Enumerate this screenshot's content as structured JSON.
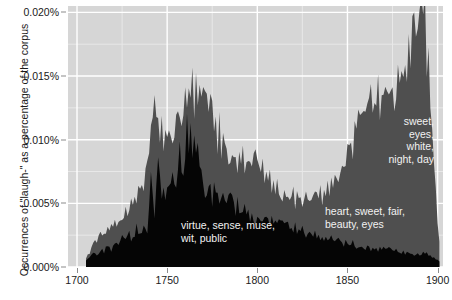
{
  "chart_data": {
    "type": "area",
    "title": "",
    "subtitle": "",
    "xlabel": "",
    "ylabel": "Occurrences of \"laugh-\" as a percentage of the corpus",
    "xlim": [
      1695,
      1903
    ],
    "ylim": [
      0.0,
      0.0205
    ],
    "grid": true,
    "legend_position": "none",
    "stacked": true,
    "x_ticks": [
      1700,
      1750,
      1800,
      1850,
      1900
    ],
    "x_tick_labels": [
      "1700",
      "1750",
      "1800",
      "1850",
      "1900"
    ],
    "x_minor_ticks": [
      1725,
      1775,
      1825,
      1875
    ],
    "y_ticks": [
      0.0,
      0.005,
      0.01,
      0.015,
      0.02
    ],
    "y_tick_labels": [
      "0.000%",
      "0.005%",
      "0.010%",
      "0.015%",
      "0.020%"
    ],
    "y_minor_ticks": [
      0.0025,
      0.0075,
      0.0125,
      0.0175
    ],
    "panel_background": "#d6d6d6",
    "gridline_major_color": "#ffffff",
    "gridline_minor_color": "#e8e8e8",
    "axis_text_color": "#1a1a1a",
    "series": [
      {
        "name": "lower-topic",
        "color": "#050505",
        "x": [
          1705,
          1707,
          1709,
          1711,
          1713,
          1715,
          1717,
          1719,
          1721,
          1723,
          1725,
          1727,
          1729,
          1731,
          1733,
          1735,
          1737,
          1739,
          1741,
          1743,
          1745,
          1747,
          1749,
          1751,
          1753,
          1755,
          1757,
          1759,
          1761,
          1763,
          1765,
          1767,
          1769,
          1771,
          1773,
          1775,
          1777,
          1779,
          1781,
          1783,
          1785,
          1787,
          1789,
          1791,
          1793,
          1795,
          1797,
          1799,
          1801,
          1803,
          1805,
          1807,
          1809,
          1811,
          1813,
          1815,
          1817,
          1819,
          1821,
          1823,
          1825,
          1827,
          1829,
          1831,
          1833,
          1835,
          1837,
          1839,
          1841,
          1843,
          1845,
          1847,
          1849,
          1851,
          1853,
          1855,
          1857,
          1859,
          1861,
          1863,
          1865,
          1867,
          1869,
          1871,
          1873,
          1875,
          1877,
          1879,
          1881,
          1883,
          1885,
          1887,
          1889,
          1891,
          1893,
          1895,
          1897,
          1899,
          1901
        ],
        "values": [
          0.0005,
          0.0008,
          0.0012,
          0.001,
          0.0014,
          0.0011,
          0.0017,
          0.0013,
          0.002,
          0.0016,
          0.0025,
          0.002,
          0.0026,
          0.0022,
          0.003,
          0.0025,
          0.0036,
          0.003,
          0.0075,
          0.004,
          0.0088,
          0.0055,
          0.0062,
          0.0058,
          0.0065,
          0.006,
          0.0088,
          0.007,
          0.0105,
          0.011,
          0.0098,
          0.0105,
          0.0085,
          0.006,
          0.0068,
          0.0055,
          0.0062,
          0.005,
          0.0056,
          0.0048,
          0.0052,
          0.0045,
          0.005,
          0.0042,
          0.0046,
          0.004,
          0.0044,
          0.0038,
          0.0042,
          0.0036,
          0.004,
          0.0034,
          0.0038,
          0.0032,
          0.0036,
          0.003,
          0.0034,
          0.0029,
          0.0032,
          0.0027,
          0.003,
          0.0026,
          0.0028,
          0.0024,
          0.0026,
          0.0022,
          0.0024,
          0.0021,
          0.0023,
          0.0019,
          0.0021,
          0.0018,
          0.002,
          0.0017,
          0.0019,
          0.0016,
          0.0018,
          0.0015,
          0.0017,
          0.0014,
          0.0016,
          0.0013,
          0.0015,
          0.0013,
          0.0014,
          0.0012,
          0.0013,
          0.0011,
          0.0012,
          0.0011,
          0.0012,
          0.001,
          0.0011,
          0.001,
          0.0011,
          0.0009,
          0.0008,
          0.0006,
          0.0004
        ]
      },
      {
        "name": "upper-topic",
        "color": "#4f4f4f",
        "x": [
          1705,
          1707,
          1709,
          1711,
          1713,
          1715,
          1717,
          1719,
          1721,
          1723,
          1725,
          1727,
          1729,
          1731,
          1733,
          1735,
          1737,
          1739,
          1741,
          1743,
          1745,
          1747,
          1749,
          1751,
          1753,
          1755,
          1757,
          1759,
          1761,
          1763,
          1765,
          1767,
          1769,
          1771,
          1773,
          1775,
          1777,
          1779,
          1781,
          1783,
          1785,
          1787,
          1789,
          1791,
          1793,
          1795,
          1797,
          1799,
          1801,
          1803,
          1805,
          1807,
          1809,
          1811,
          1813,
          1815,
          1817,
          1819,
          1821,
          1823,
          1825,
          1827,
          1829,
          1831,
          1833,
          1835,
          1837,
          1839,
          1841,
          1843,
          1845,
          1847,
          1849,
          1851,
          1853,
          1855,
          1857,
          1859,
          1861,
          1863,
          1865,
          1867,
          1869,
          1871,
          1873,
          1875,
          1877,
          1879,
          1881,
          1883,
          1885,
          1887,
          1889,
          1891,
          1893,
          1895,
          1897,
          1899,
          1901
        ],
        "values": [
          0.0003,
          0.0004,
          0.0006,
          0.0008,
          0.001,
          0.0013,
          0.0012,
          0.0018,
          0.0014,
          0.0022,
          0.0016,
          0.0028,
          0.002,
          0.0034,
          0.0022,
          0.004,
          0.0024,
          0.0048,
          0.0022,
          0.0085,
          0.002,
          0.0055,
          0.0044,
          0.0048,
          0.0042,
          0.0062,
          0.0038,
          0.0068,
          0.003,
          0.0028,
          0.004,
          0.003,
          0.0048,
          0.007,
          0.005,
          0.0062,
          0.0044,
          0.0058,
          0.0042,
          0.0054,
          0.0038,
          0.005,
          0.0036,
          0.0046,
          0.0034,
          0.0044,
          0.0032,
          0.0042,
          0.003,
          0.004,
          0.0028,
          0.0038,
          0.0026,
          0.0036,
          0.0024,
          0.0034,
          0.0022,
          0.003,
          0.002,
          0.0028,
          0.0018,
          0.0026,
          0.002,
          0.003,
          0.0026,
          0.0036,
          0.0032,
          0.0044,
          0.004,
          0.0056,
          0.005,
          0.0066,
          0.0062,
          0.008,
          0.0076,
          0.0094,
          0.009,
          0.0104,
          0.01,
          0.0112,
          0.0108,
          0.012,
          0.0116,
          0.0128,
          0.0122,
          0.0134,
          0.013,
          0.0142,
          0.0138,
          0.0152,
          0.015,
          0.0168,
          0.0172,
          0.0182,
          0.019,
          0.0148,
          0.01,
          0.0052,
          0.0016
        ]
      }
    ],
    "annotations": [
      {
        "name": "annotation-lower-topic",
        "text": "virtue, sense, muse,\nwit, public",
        "align": "left"
      },
      {
        "name": "annotation-middle-topic",
        "text": "heart, sweet, fair,\nbeauty, eyes",
        "align": "left"
      },
      {
        "name": "annotation-upper-topic",
        "text": "sweet,\neyes,\nwhite,\nnight, day",
        "align": "right"
      }
    ]
  }
}
